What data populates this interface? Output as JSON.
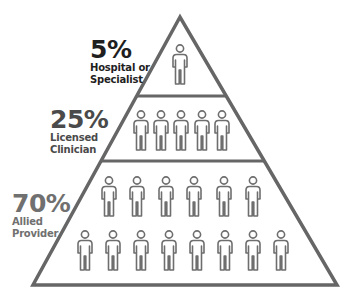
{
  "diagram": {
    "type": "pyramid",
    "tiers": [
      {
        "percent": "5%",
        "label_line1": "Hospital or",
        "label_line2": "Specialist",
        "people_count": 1,
        "text_color": "#1f1f1f"
      },
      {
        "percent": "25%",
        "label_line1": "Licensed",
        "label_line2": "Clinician",
        "people_count": 5,
        "text_color": "#4a4a4a"
      },
      {
        "percent": "70%",
        "label_line1": "Allied",
        "label_line2": "Provider",
        "people_count": 14,
        "text_color": "#707070"
      }
    ],
    "icon": "person-outline-icon",
    "line_color": "#666666",
    "icon_color": "#6e6e6e"
  }
}
